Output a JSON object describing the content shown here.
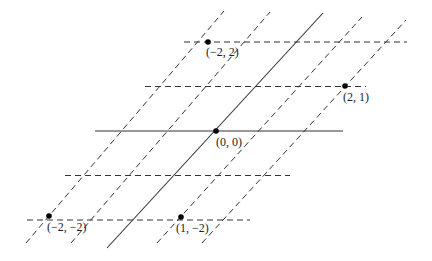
{
  "diagram": {
    "line_color": "#333333",
    "point_color": "#000000",
    "origin_px": [
      216,
      131
    ],
    "basis_a_px": [
      44.3,
      0
    ],
    "basis_b_px": [
      40.3,
      -44.5
    ],
    "horizontal_lines": [
      {
        "j": 2,
        "style": "dashed",
        "x1": 184,
        "x2": 407
      },
      {
        "j": 1,
        "style": "dashed",
        "x1": 145,
        "x2": 366
      },
      {
        "j": 0,
        "style": "solid",
        "x1": 95,
        "x2": 343
      },
      {
        "j": -1,
        "style": "dashed",
        "x1": 65,
        "x2": 290
      },
      {
        "j": -2,
        "style": "dashed",
        "x1": 27,
        "x2": 250
      }
    ],
    "slanted_lines": [
      {
        "i": -2,
        "style": "dashed",
        "bottom": [
          26,
          243
        ],
        "top": [
          224,
          11
        ]
      },
      {
        "i": -1,
        "style": "dashed",
        "bottom": [
          71,
          243
        ],
        "top": [
          270,
          12
        ]
      },
      {
        "i": 0,
        "style": "solid",
        "bottom": [
          107,
          248
        ],
        "top": [
          323,
          13
        ]
      },
      {
        "i": 1,
        "style": "dashed",
        "bottom": [
          157,
          243
        ],
        "top": [
          362,
          17
        ]
      },
      {
        "i": 2,
        "style": "dashed",
        "bottom": [
          202,
          243
        ],
        "top": [
          406,
          20
        ]
      }
    ],
    "points": [
      {
        "label": "(−2, 2)",
        "px": [
          208,
          42
        ],
        "label_px": [
          206,
          56
        ]
      },
      {
        "label": "(2, 1)",
        "px": [
          345,
          86
        ],
        "label_px": [
          343,
          101
        ]
      },
      {
        "label": "(0, 0)",
        "px": [
          216,
          131
        ],
        "label_px": [
          216,
          146
        ]
      },
      {
        "label": "(−2, −2)",
        "px": [
          49,
          216
        ],
        "label_px": [
          47,
          231
        ]
      },
      {
        "label": "(1, −2)",
        "px": [
          181,
          217
        ],
        "label_px": [
          176,
          232
        ]
      }
    ]
  }
}
